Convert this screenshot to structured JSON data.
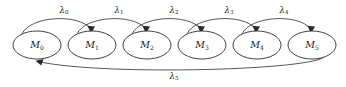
{
  "diagram": {
    "type": "state-transition-diagram",
    "title": "",
    "canvas": {
      "width": 346,
      "height": 87
    },
    "colors": {
      "background": "#ffffff",
      "stroke": "#2b2b2b",
      "label": "#1a1a1a",
      "node_fill": "#ffffff"
    },
    "nodes": [
      {
        "id": "M0",
        "symbol": "M",
        "subscript": "0",
        "cx": 37,
        "cy": 45,
        "rx": 24,
        "ry": 14
      },
      {
        "id": "M1",
        "symbol": "M",
        "subscript": "1",
        "cx": 92,
        "cy": 45,
        "rx": 24,
        "ry": 14
      },
      {
        "id": "M2",
        "symbol": "M",
        "subscript": "2",
        "cx": 147,
        "cy": 45,
        "rx": 24,
        "ry": 14
      },
      {
        "id": "M3",
        "symbol": "M",
        "subscript": "3",
        "cx": 202,
        "cy": 45,
        "rx": 24,
        "ry": 14
      },
      {
        "id": "M4",
        "symbol": "M",
        "subscript": "4",
        "cx": 257,
        "cy": 45,
        "rx": 24,
        "ry": 14
      },
      {
        "id": "M5",
        "symbol": "M",
        "subscript": "5",
        "cx": 312,
        "cy": 45,
        "rx": 24,
        "ry": 14
      }
    ],
    "edges": [
      {
        "id": "e0",
        "from": "M0",
        "to": "M1",
        "symbol": "λ",
        "subscript": "0",
        "label_x": 64,
        "label_y": 10,
        "path": "M 22 34 C 30 16, 78 13, 91 29",
        "arrow": "M 91 33.5 L 87.4 25.8 L 95.0 26.6 Z"
      },
      {
        "id": "e1",
        "from": "M1",
        "to": "M2",
        "symbol": "λ",
        "subscript": "1",
        "label_x": 119,
        "label_y": 10,
        "path": "M 77 34 C 85 16, 133 13, 146 29",
        "arrow": "M 146 33.5 L 142.4 25.8 L 150.0 26.6 Z"
      },
      {
        "id": "e2",
        "from": "M2",
        "to": "M3",
        "symbol": "λ",
        "subscript": "2",
        "label_x": 174,
        "label_y": 10,
        "path": "M 132 34 C 140 16, 188 13, 201 29",
        "arrow": "M 201 33.5 L 197.4 25.8 L 205.0 26.6 Z"
      },
      {
        "id": "e3",
        "from": "M3",
        "to": "M4",
        "symbol": "λ",
        "subscript": "3",
        "label_x": 229,
        "label_y": 10,
        "path": "M 187 34 C 195 16, 243 13, 256 29",
        "arrow": "M 256 33.5 L 252.4 25.8 L 260.0 26.6 Z"
      },
      {
        "id": "e4",
        "from": "M4",
        "to": "M5",
        "symbol": "λ",
        "subscript": "4",
        "label_x": 284,
        "label_y": 10,
        "path": "M 242 34 C 250 16, 298 13, 311 29",
        "arrow": "M 311 33.5 L 307.4 25.8 L 315.0 26.6 Z"
      },
      {
        "id": "e5",
        "from": "M5",
        "to": "M0",
        "symbol": "λ",
        "subscript": "5",
        "label_x": 174,
        "label_y": 76,
        "path": "M 325 56 C 318 70, 110 76, 40 62",
        "arrow": "M 35.5 60.8 L 43.6 58.9 L 41.2 65.6 Z"
      }
    ]
  }
}
